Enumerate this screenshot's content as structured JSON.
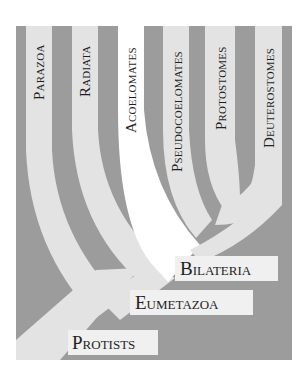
{
  "colors": {
    "background": "#9c9c9c",
    "band_light": "#e3e3e3",
    "band_white": "#ffffff",
    "label_box": "#f0f0f0",
    "text": "#1f1f1f"
  },
  "clades": {
    "parazoa": "Parazoa",
    "radiata": "Radiata",
    "acoelomates": "Acoelomates",
    "pseudocoelomates": "Pseudocoelomates",
    "protostomes": "Protostomes",
    "deuterostomes": "Deuterostomes"
  },
  "nodes": {
    "bilateria": "Bilateria",
    "eumetazoa": "Eumetazoa",
    "protists": "Protists"
  }
}
